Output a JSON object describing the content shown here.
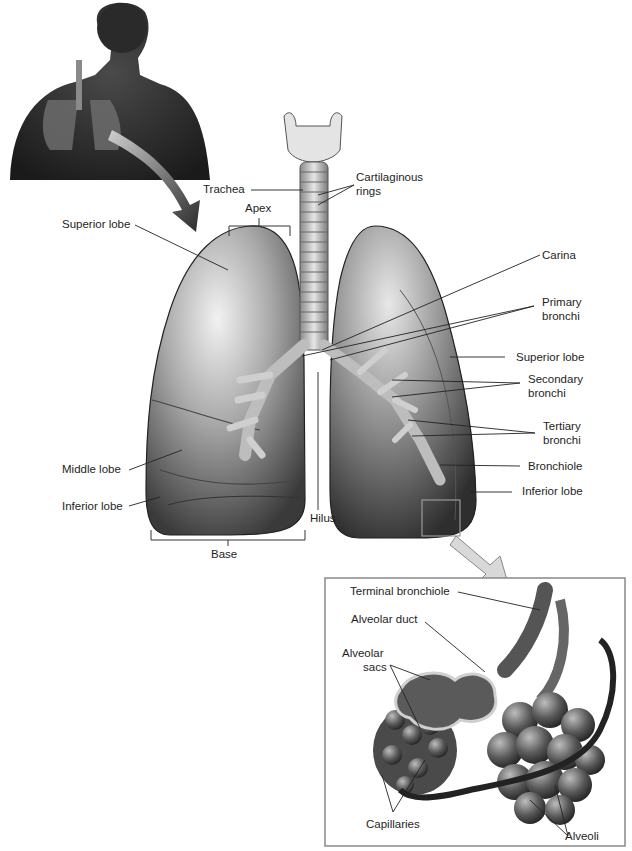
{
  "figure": {
    "inset_human": {
      "description": "Human torso silhouette showing respiratory system"
    },
    "labels": {
      "trachea": "Trachea",
      "cartilaginous_rings_1": "Cartilaginous",
      "cartilaginous_rings_2": "rings",
      "apex": "Apex",
      "superior_lobe_left": "Superior lobe",
      "middle_lobe": "Middle lobe",
      "inferior_lobe_left": "Inferior lobe",
      "base": "Base",
      "hilus": "Hilus",
      "carina": "Carina",
      "primary_bronchi_1": "Primary",
      "primary_bronchi_2": "bronchi",
      "superior_lobe_right": "Superior lobe",
      "secondary_bronchi_1": "Secondary",
      "secondary_bronchi_2": "bronchi",
      "tertiary_bronchi_1": "Tertiary",
      "tertiary_bronchi_2": "bronchi",
      "bronchiole": "Bronchiole",
      "inferior_lobe_right": "Inferior lobe"
    },
    "detail_inset": {
      "terminal_bronchiole": "Terminal bronchiole",
      "alveolar_duct": "Alveolar duct",
      "alveolar_sacs_1": "Alveolar",
      "alveolar_sacs_2": "sacs",
      "capillaries": "Capillaries",
      "alveoli": "Alveoli"
    }
  }
}
